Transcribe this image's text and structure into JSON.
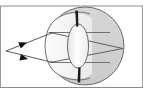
{
  "figure": {
    "caption": "",
    "width": 143,
    "height": 93,
    "background_color": "#ffffff"
  },
  "frame": {
    "top_rule": {
      "name": "top-border-rule",
      "color": "#808080",
      "y": 6,
      "x1": 0,
      "x2": 143,
      "thickness": 1
    },
    "bottom_rule": {
      "name": "bottom-border-rule",
      "color": "#808080",
      "y": 87,
      "x1": 0,
      "x2": 143,
      "thickness": 1
    },
    "left_rule": {
      "name": "left-border-rule",
      "color": "#808080",
      "x": 1,
      "y1": 6,
      "y2": 87,
      "thickness": 1
    },
    "right_rule": {
      "name": "right-border-rule",
      "color": "#808080",
      "x": 142,
      "y1": 6,
      "y2": 87,
      "thickness": 1
    }
  },
  "colors": {
    "sclera_fill": "#d2d2d2",
    "cornea_fill": "#f2f2f2",
    "anterior_chamber_fill": "#fafafa",
    "lens_fill": "#fbfbfb",
    "lens_shade": "#e8e8e8",
    "iris_dark": "#1c1c1c",
    "outline": "#555555",
    "ray_color": "#4a4a4a",
    "arrow_fill": "#111111",
    "page_background": "#ffffff"
  },
  "anatomy": {
    "eyeball": {
      "label": "eyeball-sclera",
      "shape": "circle",
      "center_x": 85,
      "center_y": 46,
      "radius": 39,
      "fill": "#d2d2d2",
      "stroke": "#555555"
    },
    "cornea": {
      "label": "cornea-bulge",
      "shape": "anterior-dome",
      "apex_x": 46,
      "top_y": 22,
      "bottom_y": 71,
      "fill": "#f2f2f2",
      "stroke": "#555555"
    },
    "lens": {
      "label": "crystalline-lens",
      "shape": "ellipse",
      "center_x": 78,
      "center_y": 46,
      "rx": 10,
      "ry": 22,
      "fill": "#fbfbfb",
      "stroke": "#555555"
    },
    "iris_top": {
      "label": "iris-superior",
      "shape": "tapered-bar",
      "x": 76,
      "y_top": 11,
      "y_bottom": 26,
      "fill": "#1c1c1c"
    },
    "iris_bottom": {
      "label": "iris-inferior",
      "shape": "tapered-bar",
      "x": 78,
      "y_top": 68,
      "y_bottom": 82,
      "fill": "#1c1c1c"
    },
    "retina_focal_point": {
      "label": "retina-focal-point",
      "x": 123,
      "y": 49
    },
    "object_point": {
      "label": "object-point-source",
      "x": 6,
      "y": 51
    }
  },
  "rays": [
    {
      "name": "upper-incident-ray",
      "from_x": 6,
      "from_y": 51,
      "to_x": 52,
      "to_y": 33,
      "arrow_at_x": 27,
      "arrow_at_y": 43,
      "arrow_direction": "right"
    },
    {
      "name": "lower-incident-ray",
      "from_x": 6,
      "from_y": 51,
      "to_x": 52,
      "to_y": 62,
      "arrow_at_x": 28,
      "arrow_at_y": 58,
      "arrow_direction": "right"
    },
    {
      "name": "upper-refracted-ray",
      "from_x": 52,
      "from_y": 33,
      "to_x": 123,
      "to_y": 49
    },
    {
      "name": "lower-refracted-ray",
      "from_x": 52,
      "from_y": 62,
      "to_x": 123,
      "to_y": 49
    },
    {
      "name": "upper-chord-line",
      "from_x": 52,
      "from_y": 33,
      "to_x": 104,
      "to_y": 33
    },
    {
      "name": "lower-chord-line",
      "from_x": 52,
      "from_y": 62,
      "to_x": 104,
      "to_y": 62
    }
  ],
  "arrowheads": [
    {
      "name": "upper-ray-arrowhead",
      "x": 27,
      "y": 43,
      "angle_deg": -21,
      "size": 7
    },
    {
      "name": "lower-ray-arrowhead",
      "x": 28,
      "y": 58,
      "angle_deg": 14,
      "size": 7
    }
  ],
  "annotations": {
    "visible_text": []
  }
}
